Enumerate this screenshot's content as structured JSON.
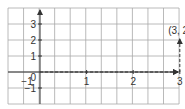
{
  "figure": {
    "grid": {
      "x0": 8,
      "y0": 8,
      "cols": 11,
      "rows": 6,
      "cell_w": 15.55,
      "cell_h": 16,
      "color": "#a8a8a8"
    },
    "axes": {
      "origin_px": [
        40,
        72
      ],
      "x_unit_px": 46.6,
      "y_unit_px": 16,
      "color": "#333333",
      "origin_label": "0"
    },
    "x_ticks": [
      {
        "value": -1,
        "label": "−1"
      },
      {
        "value": 1,
        "label": "1"
      },
      {
        "value": 2,
        "label": "2"
      },
      {
        "value": 3,
        "label": "3"
      }
    ],
    "y_ticks": [
      {
        "value": -1,
        "label": "−1"
      },
      {
        "value": 1,
        "label": "1"
      },
      {
        "value": 2,
        "label": "2"
      },
      {
        "value": 3,
        "label": "3"
      }
    ],
    "point": {
      "x": 3,
      "y": 2,
      "label": "(3, 2)"
    },
    "path_style": "dashed arrows: from origin right 3 units, then up 2 units"
  },
  "chart_data": {
    "type": "scatter",
    "title": "",
    "xlabel": "",
    "ylabel": "",
    "x_ticks": [
      -1,
      1,
      2,
      3
    ],
    "y_ticks": [
      -1,
      1,
      2,
      3
    ],
    "xlim": [
      -0.7,
      3.0
    ],
    "ylim": [
      -2,
      4
    ],
    "grid": true,
    "points": [
      {
        "x": 3,
        "y": 2,
        "label": "(3, 2)"
      }
    ],
    "annotations": [
      {
        "type": "dashed-arrow",
        "from": [
          0,
          0
        ],
        "to": [
          3,
          0
        ]
      },
      {
        "type": "dashed-arrow",
        "from": [
          3,
          0
        ],
        "to": [
          3,
          2
        ]
      }
    ]
  }
}
